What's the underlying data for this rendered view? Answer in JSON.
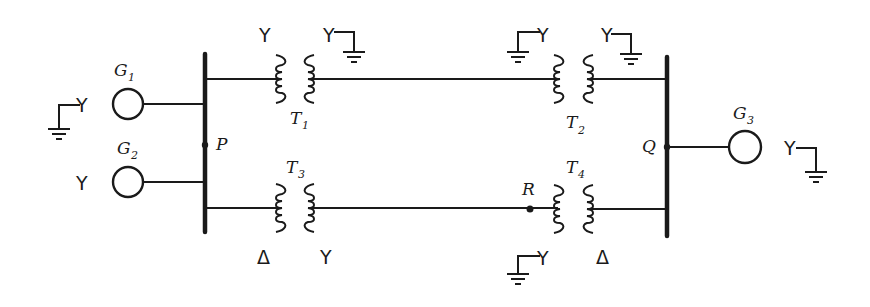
{
  "diagram": {
    "type": "power-system-one-line",
    "buses": [
      {
        "id": "P",
        "label": "P"
      },
      {
        "id": "Q",
        "label": "Q"
      }
    ],
    "nodes": [
      {
        "id": "R",
        "label": "R"
      }
    ],
    "generators": [
      {
        "id": "G1",
        "letter": "G",
        "sub": "1",
        "connection": "Y",
        "grounded": true,
        "bus": "P"
      },
      {
        "id": "G2",
        "letter": "G",
        "sub": "2",
        "connection": "Y",
        "grounded": false,
        "bus": "P"
      },
      {
        "id": "G3",
        "letter": "G",
        "sub": "3",
        "connection": "Y",
        "grounded": true,
        "bus": "Q"
      }
    ],
    "transformers": [
      {
        "id": "T1",
        "letter": "T",
        "sub": "1",
        "left": "Y",
        "left_grounded": false,
        "right": "Y",
        "right_grounded": true
      },
      {
        "id": "T2",
        "letter": "T",
        "sub": "2",
        "left": "Y",
        "left_grounded": true,
        "right": "Y",
        "right_grounded": true
      },
      {
        "id": "T3",
        "letter": "T",
        "sub": "3",
        "left": "Δ",
        "left_grounded": false,
        "right": "Y",
        "right_grounded": false
      },
      {
        "id": "T4",
        "letter": "T",
        "sub": "4",
        "left": "Y",
        "left_grounded": true,
        "right": "Δ",
        "right_grounded": false
      }
    ],
    "symbols": {
      "wye": "Y",
      "delta": "Δ"
    }
  }
}
